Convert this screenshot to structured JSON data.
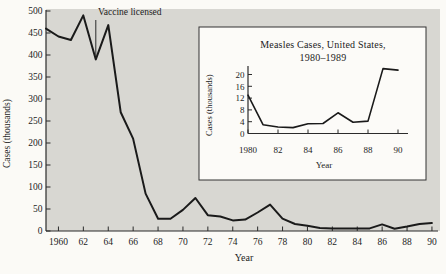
{
  "figure": {
    "colors": {
      "page_bg": "#fbfaf6",
      "plot_bg": "#d8d7d2",
      "inset_bg": "#fcfbf8",
      "series_line": "#1a1a1a",
      "axis": "#2b2b2b",
      "text": "#1c1c1c"
    }
  },
  "chart_data": [
    {
      "id": "main",
      "type": "line",
      "title": "",
      "xlabel": "Year",
      "ylabel": "Cases (thousands)",
      "xlim": [
        1959,
        1990.6
      ],
      "ylim": [
        0,
        500
      ],
      "grid": false,
      "x_ticks": [
        1960,
        1962,
        1964,
        1966,
        1968,
        1970,
        1972,
        1974,
        1976,
        1978,
        1980,
        1982,
        1984,
        1986,
        1988,
        1990
      ],
      "x_tick_labels": [
        "1960",
        "62",
        "64",
        "66",
        "68",
        "70",
        "72",
        "74",
        "76",
        "78",
        "80",
        "82",
        "84",
        "86",
        "88",
        "90"
      ],
      "y_ticks": [
        0,
        50,
        100,
        150,
        200,
        250,
        300,
        350,
        400,
        450,
        500
      ],
      "annotation": {
        "text": "Vaccine licensed",
        "year": 1963
      },
      "x": [
        1959,
        1960,
        1961,
        1962,
        1963,
        1964,
        1965,
        1966,
        1967,
        1968,
        1969,
        1970,
        1971,
        1972,
        1973,
        1974,
        1975,
        1976,
        1977,
        1978,
        1979,
        1980,
        1981,
        1982,
        1983,
        1984,
        1985,
        1986,
        1987,
        1988,
        1989,
        1990
      ],
      "values": [
        460,
        442,
        434,
        490,
        390,
        468,
        270,
        210,
        85,
        28,
        28,
        48,
        75,
        36,
        33,
        24,
        26,
        42,
        60,
        28,
        16,
        12,
        7,
        6,
        6,
        6,
        6,
        15,
        5,
        10,
        16,
        18
      ]
    },
    {
      "id": "inset",
      "type": "line",
      "title": "Measles Cases, United States,",
      "subtitle": "1980–1989",
      "xlabel": "Year",
      "ylabel": "Cases (thousands)",
      "xlim": [
        1980,
        1990.7
      ],
      "ylim": [
        0,
        22.9
      ],
      "grid": false,
      "x_ticks": [
        1980,
        1982,
        1984,
        1986,
        1988,
        1990
      ],
      "x_tick_labels": [
        "1980",
        "82",
        "84",
        "86",
        "88",
        "90"
      ],
      "y_ticks": [
        0,
        4,
        8,
        12,
        16,
        20
      ],
      "x": [
        1980,
        1981,
        1982,
        1983,
        1984,
        1985,
        1986,
        1987,
        1988,
        1989,
        1990
      ],
      "values": [
        13,
        3,
        2.2,
        2,
        3.3,
        3.4,
        7,
        3.8,
        4.2,
        22,
        21.5
      ]
    }
  ]
}
